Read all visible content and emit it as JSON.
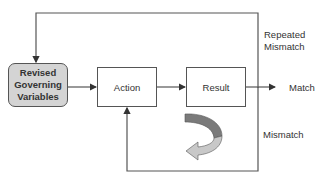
{
  "diagram": {
    "nodes": {
      "governing_variables": {
        "line1": "Revised",
        "line2": "Governing",
        "line3": "Variables"
      },
      "action": {
        "label": "Action"
      },
      "result": {
        "label": "Result"
      }
    },
    "edge_labels": {
      "repeated_mismatch_line1": "Repeated",
      "repeated_mismatch_line2": "Mismatch",
      "match": "Match",
      "mismatch": "Mismatch"
    },
    "colors": {
      "line": "#555555",
      "governing_fill": "#d4d4d4",
      "curved_arrow_dark": "#7a7a7a",
      "curved_arrow_light": "#c8c8c8"
    }
  }
}
